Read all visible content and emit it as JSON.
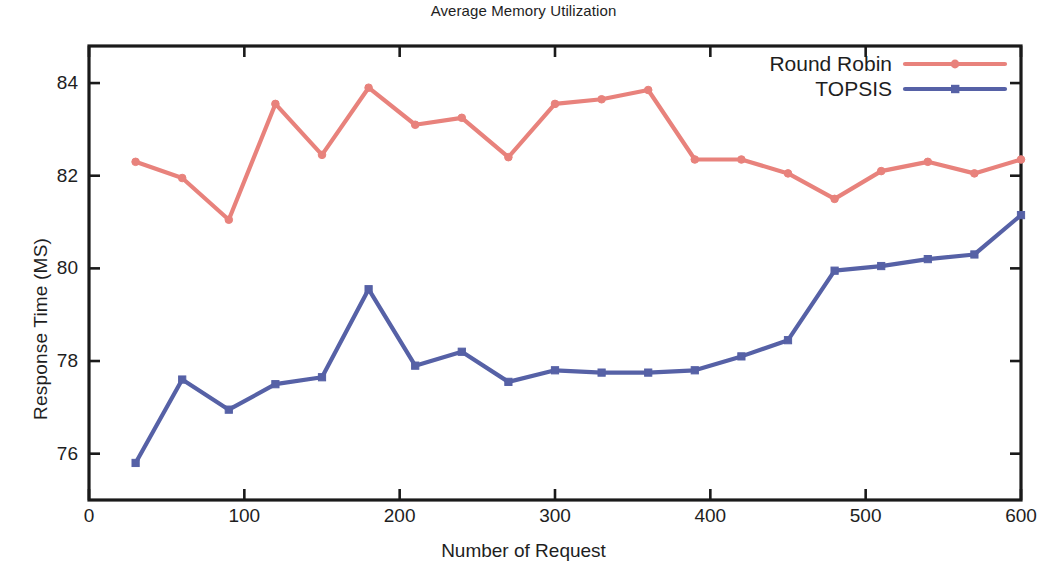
{
  "chart_data": {
    "type": "line",
    "title": "Average Memory Utilization",
    "xlabel": "Number of Request",
    "ylabel": "Response Time (MS)",
    "xlim": [
      0,
      600
    ],
    "ylim": [
      75.0,
      84.8
    ],
    "grid": false,
    "legend_position": "top-right",
    "x_ticks": [
      "0",
      "100",
      "200",
      "300",
      "400",
      "500",
      "600"
    ],
    "x_tick_values": [
      0,
      100,
      200,
      300,
      400,
      500,
      600
    ],
    "y_ticks": [
      "76",
      "78",
      "80",
      "82",
      "84"
    ],
    "y_tick_values": [
      76,
      78,
      80,
      82,
      84
    ],
    "x": [
      30,
      60,
      90,
      120,
      150,
      180,
      210,
      240,
      270,
      300,
      330,
      360,
      390,
      420,
      450,
      480,
      510,
      540,
      570,
      600
    ],
    "series": [
      {
        "name": "Round Robin",
        "color": "#e8827c",
        "marker": "circle",
        "values": [
          82.3,
          81.95,
          81.05,
          83.55,
          82.45,
          83.9,
          83.1,
          83.25,
          82.4,
          83.55,
          83.65,
          83.85,
          82.35,
          82.35,
          82.05,
          81.5,
          82.1,
          82.3,
          82.05,
          82.35
        ]
      },
      {
        "name": "TOPSIS",
        "color": "#5661a6",
        "marker": "square",
        "values": [
          75.8,
          77.6,
          76.95,
          77.5,
          77.65,
          79.55,
          77.9,
          78.2,
          77.55,
          77.8,
          77.75,
          77.75,
          77.8,
          78.1,
          78.45,
          79.95,
          80.05,
          80.2,
          80.3,
          81.15
        ]
      }
    ]
  },
  "legend": {
    "items": [
      {
        "label": "Round Robin",
        "color": "#e8827c",
        "marker": "circle"
      },
      {
        "label": "TOPSIS",
        "color": "#5661a6",
        "marker": "square"
      }
    ]
  },
  "axes": {
    "title": "Average Memory Utilization",
    "x_title": "Number of Request",
    "y_title": "Response Time (MS)"
  }
}
